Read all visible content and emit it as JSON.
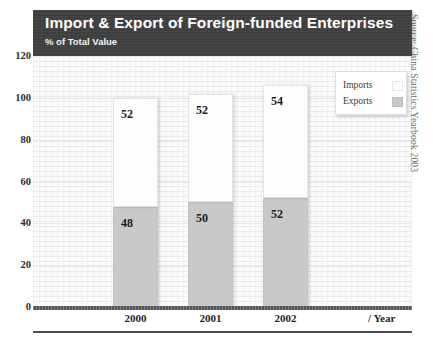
{
  "chart_data": {
    "type": "bar",
    "subtype": "stacked-bar",
    "title": "Import & Export of Foreign-funded Enterprises",
    "subtitle": "% of Total Value",
    "xlabel": "/ Year",
    "ylabel": "",
    "categories": [
      "2000",
      "2001",
      "2002"
    ],
    "series": [
      {
        "name": "Exports",
        "values": [
          48,
          50,
          52
        ],
        "color": "#c9c9c9"
      },
      {
        "name": "Imports",
        "values": [
          52,
          52,
          54
        ],
        "color": "#fdfdfd"
      }
    ],
    "totals": [
      100,
      102,
      106
    ],
    "ylim": [
      0,
      120
    ],
    "yticks": [
      "0",
      "20",
      "40",
      "60",
      "80",
      "100",
      "120"
    ],
    "ytick_values": [
      0,
      20,
      40,
      60,
      80,
      100,
      120
    ],
    "grid": true,
    "legend_position": "top-right",
    "source": "Source: China Statistics Yearbook 2003"
  },
  "legend": {
    "entries": [
      {
        "label": "Imports",
        "swatch": "imports"
      },
      {
        "label": "Exports",
        "swatch": "exports"
      }
    ]
  },
  "colors": {
    "title_bar": "#3d3d3d",
    "imports": "#fdfdfd",
    "exports": "#c9c9c9",
    "axis": "#555558",
    "text": "#1f1f1f"
  }
}
